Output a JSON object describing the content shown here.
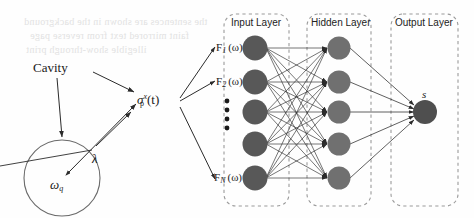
{
  "figure": {
    "background_bleed": [
      "the sentences are shown in the background",
      "faint mirrored text from reverse page",
      "illegible show-through print"
    ],
    "left_diagram": {
      "cavity_label": "Cavity",
      "qubit_label_base": "ω",
      "qubit_label_sub": "q",
      "coupling_label": "λ",
      "sigma_symbol": "σ",
      "sigma_sub": "p",
      "sigma_sup": "x",
      "sigma_arg": "(t)"
    },
    "network": {
      "boxes": [
        {
          "label": "Input Layer"
        },
        {
          "label": "Hidden Layer"
        },
        {
          "label": "Output Layer"
        }
      ],
      "input_nodes": [
        {
          "label_base": "F",
          "label_sub": "1",
          "label_arg": "(ω)"
        },
        {
          "label_base": "F",
          "label_sub": "2",
          "label_arg": "(ω)"
        },
        {
          "label_base": "",
          "label_sub": "",
          "label_arg": ""
        },
        {
          "label_base": "",
          "label_sub": "",
          "label_arg": ""
        },
        {
          "label_base": "F",
          "label_sub": "N",
          "label_arg": "(ω)"
        }
      ],
      "vertical_dots_count": 4,
      "hidden_node_count": 5,
      "output_label": "s"
    },
    "colors": {
      "input_node": "#585858",
      "hidden_node": "#707070",
      "output_node": "#4f4f4f",
      "box_border": "#9a9a9a",
      "edge": "#2b2b2b",
      "circle_stroke": "#6a6a6a"
    }
  }
}
